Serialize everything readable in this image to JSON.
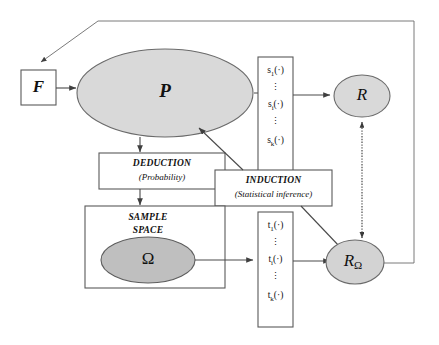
{
  "diagram": {
    "type": "flow-diagram",
    "nodes": {
      "f_box": {
        "label": "F",
        "shape": "rectangle"
      },
      "p_ellipse": {
        "label": "P",
        "shape": "ellipse",
        "fill": "#d9d9d9"
      },
      "r_ellipse": {
        "label": "R",
        "shape": "ellipse",
        "fill": "#d9d9d9"
      },
      "r_omega_ellipse": {
        "label": "R",
        "subscript": "Ω",
        "shape": "ellipse",
        "fill": "#d3d3d3"
      },
      "omega_ellipse": {
        "label": "Ω",
        "shape": "ellipse",
        "fill": "#bfbfbf"
      },
      "deduction_box": {
        "title": "DEDUCTION",
        "subtitle": "(Probability)",
        "shape": "rectangle"
      },
      "induction_box": {
        "title": "INDUCTION",
        "subtitle": "(Statistical inference)",
        "shape": "rectangle"
      },
      "sample_space_box": {
        "line1": "SAMPLE",
        "line2": "SPACE",
        "shape": "rectangle"
      }
    },
    "s_column": {
      "name": "statistics-column-s",
      "entries": [
        {
          "base": "s",
          "sub": "1",
          "arg": "(·)",
          "text": "s₁(·)"
        },
        {
          "base": "",
          "sub": "",
          "arg": "",
          "text": "⋮"
        },
        {
          "base": "s",
          "sub": "i",
          "arg": "(·)",
          "text": "sᵢ(·)"
        },
        {
          "base": "",
          "sub": "",
          "arg": "",
          "text": "⋮"
        },
        {
          "base": "s",
          "sub": "k",
          "arg": "(·)",
          "text": "sₖ(·)"
        }
      ]
    },
    "t_column": {
      "name": "statistics-column-t",
      "entries": [
        {
          "base": "t",
          "sub": "1",
          "arg": "(·)",
          "text": "t₁(·)"
        },
        {
          "base": "",
          "sub": "",
          "arg": "",
          "text": "⋮"
        },
        {
          "base": "t",
          "sub": "i",
          "arg": "(·)",
          "text": "tᵢ(·)"
        },
        {
          "base": "",
          "sub": "",
          "arg": "",
          "text": "⋮"
        },
        {
          "base": "t",
          "sub": "k",
          "arg": "(·)",
          "text": "tₖ(·)"
        }
      ]
    },
    "edges": [
      {
        "name": "f-to-p",
        "from": "F",
        "to": "P",
        "style": "solid-arrow"
      },
      {
        "name": "p-to-s-column",
        "from": "P",
        "to": "s-column",
        "style": "solid-arrow"
      },
      {
        "name": "s-column-to-r",
        "from": "s-column",
        "to": "R",
        "style": "solid-arrow"
      },
      {
        "name": "p-to-deduction",
        "from": "P",
        "to": "DEDUCTION",
        "style": "solid-arrow"
      },
      {
        "name": "deduction-to-sample-space",
        "from": "DEDUCTION",
        "to": "SAMPLE SPACE",
        "style": "solid-arrow"
      },
      {
        "name": "omega-to-t-column",
        "from": "Ω",
        "to": "t-column",
        "style": "solid-arrow"
      },
      {
        "name": "t-column-to-r-omega",
        "from": "t-column",
        "to": "RΩ",
        "style": "solid-arrow"
      },
      {
        "name": "induction-to-p",
        "from": "INDUCTION",
        "to": "P",
        "style": "solid-arrow"
      },
      {
        "name": "induction-to-r-omega",
        "from": "INDUCTION",
        "to": "RΩ",
        "style": "solid-line"
      },
      {
        "name": "r-to-r-omega-comparison",
        "from": "R",
        "to": "RΩ",
        "style": "dotted-double-arrow"
      },
      {
        "name": "r-omega-feedback-to-f",
        "from": "RΩ",
        "to": "F",
        "style": "solid-arrow-routed"
      }
    ]
  }
}
